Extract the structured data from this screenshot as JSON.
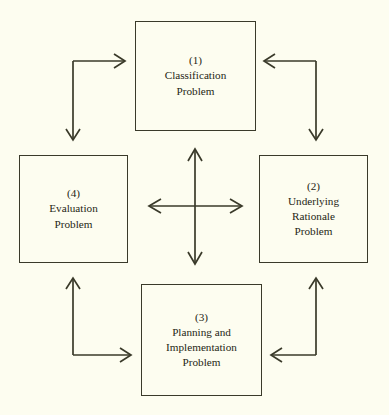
{
  "diagram": {
    "background_color": "#fdfdf0",
    "line_color": "#3a3a2a",
    "text_color": "#1f1f14",
    "nodes": [
      {
        "id": "1",
        "number": "(1)",
        "label": "Classification\nProblem",
        "position": "top"
      },
      {
        "id": "2",
        "number": "(2)",
        "label": "Underlying\nRationale\nProblem",
        "position": "right"
      },
      {
        "id": "3",
        "number": "(3)",
        "label": "Planning and\nImplementation\nProblem",
        "position": "bottom"
      },
      {
        "id": "4",
        "number": "(4)",
        "label": "Evaluation\nProblem",
        "position": "left"
      }
    ],
    "connectors": [
      {
        "id": "elbow-top-left",
        "from": "4",
        "to": "1",
        "shape": "elbow",
        "heads": [
          "right",
          "down"
        ]
      },
      {
        "id": "elbow-top-right",
        "from": "2",
        "to": "1",
        "shape": "elbow",
        "heads": [
          "left",
          "down"
        ]
      },
      {
        "id": "elbow-bottom-left",
        "from": "3",
        "to": "4",
        "shape": "elbow",
        "heads": [
          "up",
          "right"
        ]
      },
      {
        "id": "elbow-bottom-right",
        "from": "3",
        "to": "2",
        "shape": "elbow",
        "heads": [
          "up",
          "left"
        ]
      },
      {
        "id": "center-cross",
        "shape": "cross",
        "heads": [
          "up",
          "down",
          "left",
          "right"
        ]
      }
    ]
  }
}
